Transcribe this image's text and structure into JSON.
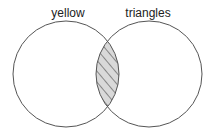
{
  "diagram": {
    "type": "venn",
    "sets": [
      {
        "label": "yellow",
        "cx": 66,
        "cy": 74,
        "r": 53
      },
      {
        "label": "triangles",
        "cx": 149,
        "cy": 74,
        "r": 53
      }
    ],
    "shaded_region": "intersection",
    "shade_pattern": "diagonal-hatch",
    "colors": {
      "stroke": "#555555",
      "fill": "#d9d9d9",
      "hatch": "#333333"
    }
  }
}
